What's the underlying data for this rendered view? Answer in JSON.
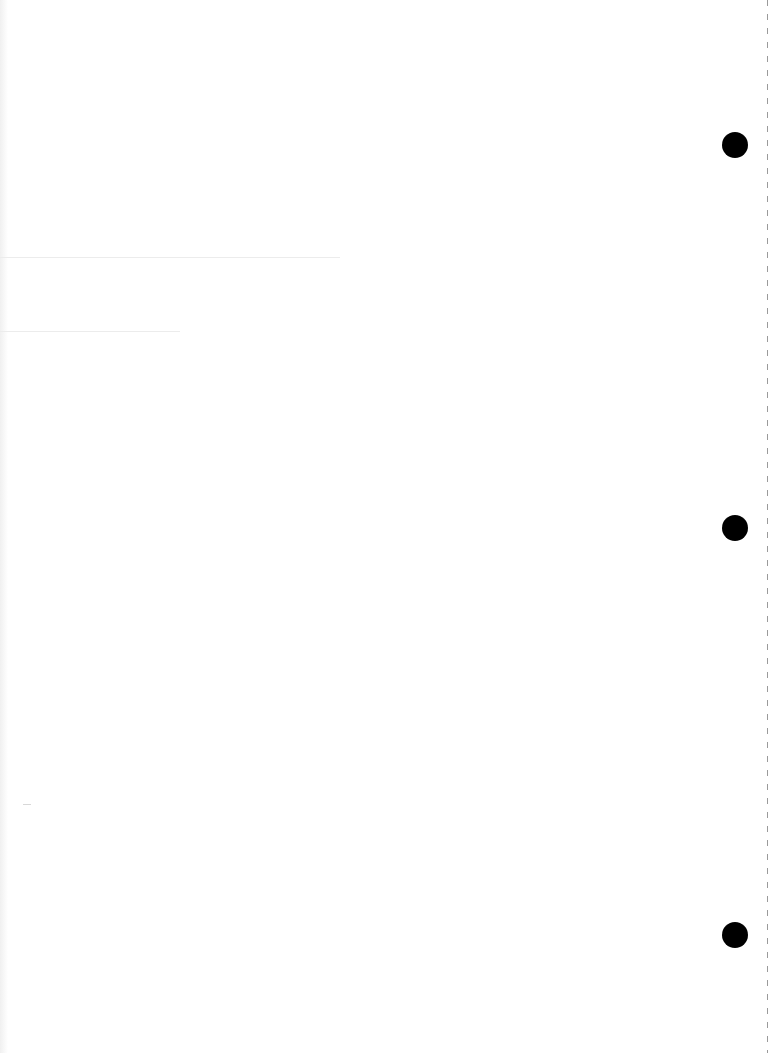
{
  "page": {
    "type": "blank binder sheet",
    "background_color": "#ffffff",
    "punch_holes": [
      {
        "x": 722,
        "y": 132,
        "d": 26
      },
      {
        "x": 722,
        "y": 515,
        "d": 26
      },
      {
        "x": 722,
        "y": 922,
        "d": 26
      }
    ],
    "hole_color": "#000000"
  }
}
